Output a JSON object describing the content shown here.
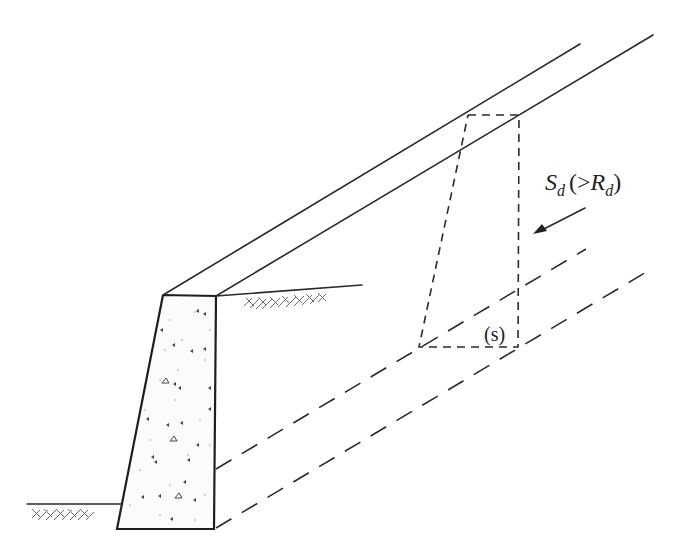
{
  "figure": {
    "colors": {
      "line": "#2a2a2a",
      "hatch": "#6b6b6b",
      "background": "#ffffff"
    }
  },
  "labels": {
    "force": {
      "main": "S",
      "main_sub": "d",
      "open": "(",
      "compare": ">",
      "resist": "R",
      "resist_sub": "d",
      "close": ")"
    },
    "wedge": "(s)"
  },
  "elements": {
    "wall": "concrete-retaining-wall",
    "backfill_slope": "slope-surface",
    "failure_wedge": "dashed-slip-block",
    "force_arrow": "driving-force-arrow",
    "ground_left": "toe-ground-surface",
    "ground_right": "heel-ground-surface"
  }
}
